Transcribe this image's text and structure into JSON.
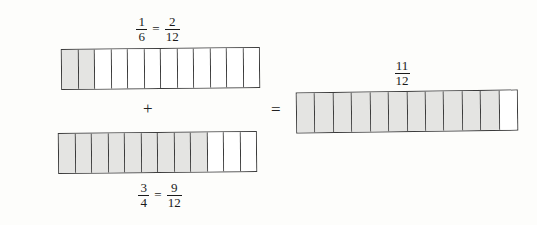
{
  "figure": {
    "background_color": "#fdfdfb",
    "line_color": "#3a3a3a",
    "shade_color": "#e4e4e2",
    "unshaded_color": "#ffffff"
  },
  "labels": {
    "addend_one": {
      "left": {
        "numerator": "1",
        "denominator": "6"
      },
      "relation": "=",
      "right": {
        "numerator": "2",
        "denominator": "12"
      }
    },
    "addend_two": {
      "left": {
        "numerator": "3",
        "denominator": "4"
      },
      "relation": "=",
      "right": {
        "numerator": "9",
        "denominator": "12"
      }
    },
    "sum": {
      "numerator": "11",
      "denominator": "12"
    }
  },
  "operators": {
    "plus": "+",
    "equals": "="
  },
  "bars": [
    {
      "name": "addend-one-bar",
      "total_cells": 12,
      "shaded_cells": 2,
      "label_text": "1/6 = 2/12",
      "label_position": "above"
    },
    {
      "name": "addend-two-bar",
      "total_cells": 12,
      "shaded_cells": 9,
      "label_text": "3/4 = 9/12",
      "label_position": "below"
    },
    {
      "name": "sum-bar",
      "total_cells": 12,
      "shaded_cells": 11,
      "label_text": "11/12",
      "label_position": "above"
    }
  ],
  "chart_data": {
    "type": "bar",
    "categories": [
      "1/6 = 2/12",
      "3/4 = 9/12",
      "11/12"
    ],
    "values": [
      2,
      9,
      11
    ],
    "series": [
      {
        "name": "shaded twelfths",
        "values": [
          2,
          9,
          11
        ]
      },
      {
        "name": "unshaded twelfths",
        "values": [
          10,
          3,
          1
        ]
      }
    ],
    "xlabel": "",
    "ylabel": "twelfths shaded",
    "ylim": [
      0,
      12
    ],
    "grid": false,
    "legend": "none",
    "annotations": [
      "+",
      "="
    ]
  }
}
